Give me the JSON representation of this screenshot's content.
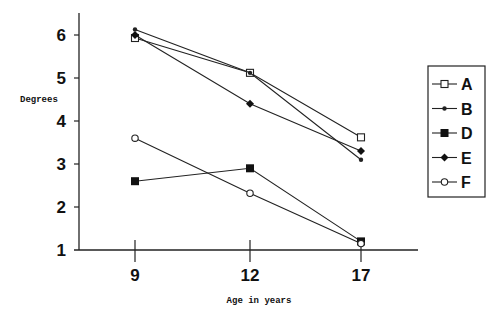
{
  "chart_data": {
    "type": "line",
    "title": "",
    "xlabel": "Age in years",
    "ylabel": "Degrees",
    "x": [
      9,
      12,
      17
    ],
    "x_tick_labels": [
      "9",
      "12",
      "17"
    ],
    "y_tick_labels": [
      "1",
      "2",
      "3",
      "4",
      "5",
      "6"
    ],
    "ylim": [
      1,
      6.5
    ],
    "grid": false,
    "legend_position": "right",
    "series": [
      {
        "name": "A",
        "marker": "open-square",
        "values": [
          5.93,
          5.12,
          3.62
        ]
      },
      {
        "name": "B",
        "marker": "small-dot",
        "values": [
          6.13,
          5.12,
          3.1
        ]
      },
      {
        "name": "D",
        "marker": "filled-square",
        "values": [
          2.6,
          2.9,
          1.2
        ]
      },
      {
        "name": "E",
        "marker": "filled-diamond",
        "values": [
          6.0,
          4.4,
          3.3
        ]
      },
      {
        "name": "F",
        "marker": "open-circle",
        "values": [
          3.6,
          2.32,
          1.15
        ]
      }
    ]
  },
  "colors": {
    "line": "#222222",
    "background": "#ffffff"
  }
}
